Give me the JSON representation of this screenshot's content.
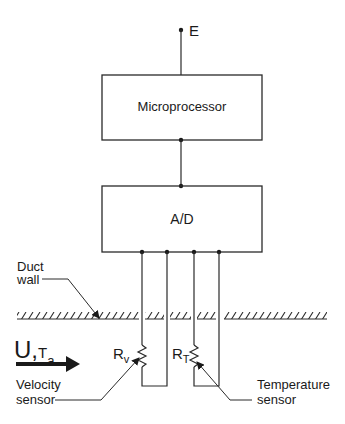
{
  "diagram": {
    "supply_label": "E",
    "microprocessor_label": "Microprocessor",
    "adc_label": "A/D",
    "duct_wall_label_line1": "Duct",
    "duct_wall_label_line2": "wall",
    "flow_velocity_symbol": "U",
    "flow_separator": ",",
    "flow_temperature_symbol": "T",
    "flow_temperature_subscript": "a",
    "velocity_resistor_symbol": "R",
    "velocity_resistor_subscript": "v",
    "temperature_resistor_symbol": "R",
    "temperature_resistor_subscript": "T",
    "velocity_sensor_line1": "Velocity",
    "velocity_sensor_line2": "sensor",
    "temperature_sensor_line1": "Temperature",
    "temperature_sensor_line2": "sensor",
    "line_color": "#2a2a2a"
  }
}
